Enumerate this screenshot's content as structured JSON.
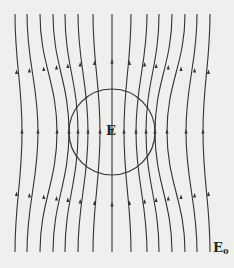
{
  "figure": {
    "labels": {
      "inside_field": "E",
      "external_field": "E",
      "external_field_subscript": "0"
    },
    "colors": {
      "background": "#efefed",
      "line": "#333333"
    },
    "sphere": {
      "cx": 112,
      "cy": 132,
      "r": 43
    },
    "field_lines": {
      "count": 15,
      "direction": "up",
      "top_x": [
        15,
        27,
        40,
        53,
        65,
        78,
        93,
        112,
        131,
        147,
        159,
        172,
        185,
        197,
        210
      ],
      "mid_x": [
        22,
        38,
        57,
        69,
        78,
        88,
        100,
        112,
        124,
        136,
        146,
        155,
        167,
        186,
        203
      ],
      "bottom_x": [
        15,
        27,
        40,
        53,
        65,
        78,
        93,
        112,
        131,
        147,
        159,
        172,
        185,
        197,
        210
      ]
    }
  }
}
